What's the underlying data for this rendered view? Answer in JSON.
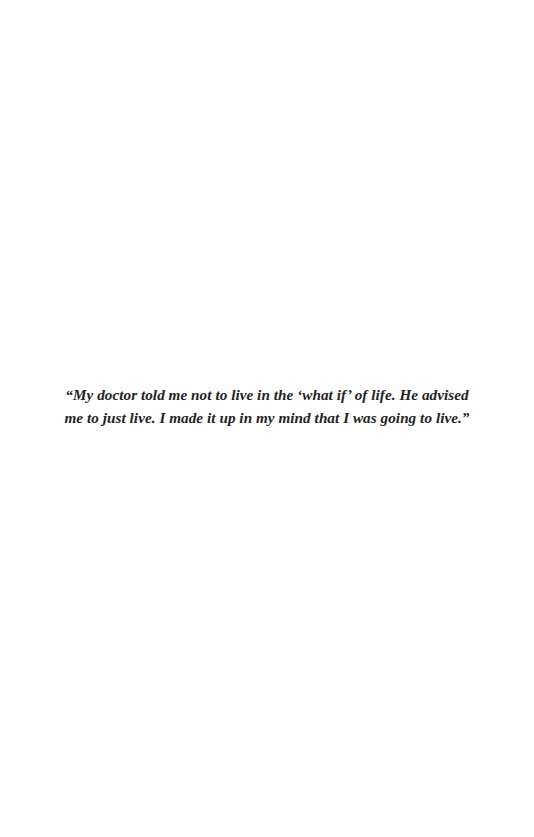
{
  "page": {
    "background": "#fefefe",
    "text_color": "#232323"
  },
  "quote": {
    "lines": [
      "“My doctor told me not to live in the ‘what if’ of life. He advised",
      "me to just live. I made it up in my mind that I was going to live.”"
    ]
  }
}
